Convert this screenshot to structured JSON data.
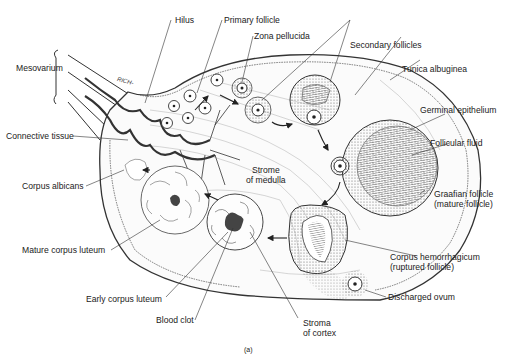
{
  "figure": {
    "panel_label": "(a)",
    "ink_color": "#2a2a2a",
    "dark_fill": "#555555",
    "stipple_color": "#777777"
  },
  "labels": {
    "hilus": "Hilus",
    "primary_follicle": "Primary follicle",
    "zona_pellucida": "Zona pellucida",
    "secondary_follicles": "Secondary follicles",
    "tunica_albuginea": "Tunica albuginea",
    "mesovarium": "Mesovarium",
    "germinal_epithelium": "Germinal epithelium",
    "connective_tissue": "Connective tissue",
    "follicular_fluid": "Follicular fluid",
    "corpus_albicans": "Corpus albicans",
    "stroma_medulla_1": "Strome",
    "stroma_medulla_2": "of medulla",
    "graafian_1": "Graafian follicle",
    "graafian_2": "(mature follicle)",
    "mature_corpus_luteum": "Mature corpus luteum",
    "corpus_hem_1": "Corpus hemorrhagicum",
    "corpus_hem_2": "(ruptured follicle)",
    "discharged_ovum": "Discharged ovum",
    "early_corpus_luteum": "Early corpus luteum",
    "blood_clot": "Blood clot",
    "stroma_cortex_1": "Stroma",
    "stroma_cortex_2": "of cortex",
    "vessel_tag": "RICH-"
  }
}
